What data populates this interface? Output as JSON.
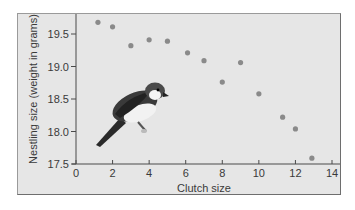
{
  "chart_data": {
    "type": "scatter",
    "title": "",
    "xlabel": "Clutch size",
    "ylabel": "Nestling size (weight in grams)",
    "xlim": [
      0,
      14
    ],
    "ylim": [
      17.5,
      19.75
    ],
    "xticks": [
      0,
      2,
      4,
      6,
      8,
      10,
      12,
      14
    ],
    "yticks": [
      17.5,
      18.0,
      18.5,
      19.0,
      19.5
    ],
    "xtick_labels": [
      "0",
      "2",
      "4",
      "6",
      "8",
      "10",
      "12",
      "14"
    ],
    "ytick_labels": [
      "17.5",
      "18.0",
      "18.5",
      "19.0",
      "19.5"
    ],
    "grid": false,
    "legend": null,
    "annotations": [
      "bird illustration (shrike-like songbird) in lower-left of plot"
    ],
    "series": [
      {
        "name": "Nestlings",
        "color": "#8a8a8a",
        "points": [
          {
            "x": 1.2,
            "y": 19.68
          },
          {
            "x": 2.0,
            "y": 19.61
          },
          {
            "x": 3.0,
            "y": 19.32
          },
          {
            "x": 4.0,
            "y": 19.41
          },
          {
            "x": 5.0,
            "y": 19.39
          },
          {
            "x": 6.1,
            "y": 19.21
          },
          {
            "x": 7.0,
            "y": 19.09
          },
          {
            "x": 8.0,
            "y": 18.76
          },
          {
            "x": 9.0,
            "y": 19.06
          },
          {
            "x": 10.0,
            "y": 18.58
          },
          {
            "x": 11.3,
            "y": 18.22
          },
          {
            "x": 12.0,
            "y": 18.04
          },
          {
            "x": 12.9,
            "y": 17.59
          }
        ]
      }
    ]
  },
  "colors": {
    "frame_bg": "#e6e6e6",
    "axis": "#4a4a4a",
    "point": "#8a8a8a",
    "text": "#3a3a3a"
  }
}
